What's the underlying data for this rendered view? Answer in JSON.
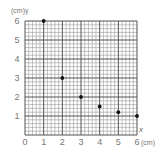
{
  "figure": {
    "question_label": ")",
    "y_axis_label": "(cm)y",
    "x_axis_var": "x",
    "x_axis_unit": "(cm)"
  },
  "chart_data": {
    "type": "scatter",
    "title": "",
    "xlabel": "x (cm)",
    "ylabel": "y (cm)",
    "x": [
      1,
      2,
      3,
      4,
      5,
      6
    ],
    "y": [
      6,
      3,
      2,
      1.5,
      1.2,
      1
    ],
    "series": [
      {
        "name": "points",
        "x": [
          1,
          2,
          3,
          4,
          5,
          6
        ],
        "y": [
          6,
          3,
          2,
          1.5,
          1.2,
          1
        ]
      }
    ],
    "x_ticks": [
      "0",
      "1",
      "2",
      "3",
      "4",
      "5",
      "6"
    ],
    "y_ticks": [
      "1",
      "2",
      "3",
      "4",
      "5",
      "6"
    ],
    "xlim": [
      0,
      6
    ],
    "ylim": [
      0,
      6
    ],
    "grid": {
      "on": true,
      "major_step": 1,
      "minor_divisions": 5
    },
    "legend": null,
    "colors": {
      "grid_major": "#555555",
      "grid_minor": "#9a9a9a",
      "point": "#111111"
    }
  }
}
